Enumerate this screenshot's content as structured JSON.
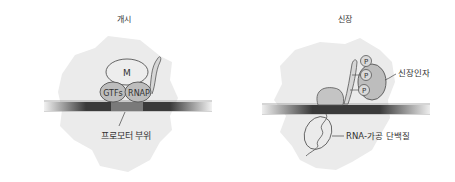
{
  "panels": [
    {
      "title": "개시",
      "complex_labels": {
        "mediator": "M",
        "gtfs": "GTFs",
        "rnap": "RNAP"
      },
      "callout": "프로모터 부위"
    },
    {
      "title": "신장",
      "phospho_labels": [
        "P",
        "P",
        "P"
      ],
      "callouts": {
        "elongation_factor": "신장인자",
        "rna_processing": "RNA-가공 단백질"
      }
    }
  ],
  "colors": {
    "blob": "#ebebeb",
    "dna_dark": "#3a3a3a",
    "promoter": "#7a7a7a",
    "protein_fill": "#bdbdbd",
    "mediator_fill": "#ededed",
    "outline": "#555555"
  }
}
